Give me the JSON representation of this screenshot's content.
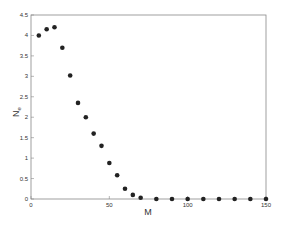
{
  "chart_data": {
    "type": "scatter",
    "title": "",
    "xlabel": "M",
    "ylabel": "N_e",
    "xlim": [
      0,
      150
    ],
    "ylim": [
      0,
      4.5
    ],
    "xticks": [
      0,
      50,
      100,
      150
    ],
    "yticks": [
      0,
      0.5,
      1,
      1.5,
      2,
      2.5,
      3,
      3.5,
      4,
      4.5
    ],
    "grid": false,
    "x": [
      5,
      10,
      15,
      20,
      25,
      30,
      35,
      40,
      45,
      50,
      55,
      60,
      65,
      70,
      80,
      90,
      100,
      110,
      120,
      130,
      140,
      150
    ],
    "y": [
      4.0,
      4.15,
      4.2,
      3.7,
      3.02,
      2.35,
      2.0,
      1.6,
      1.3,
      0.88,
      0.58,
      0.25,
      0.1,
      0.03,
      0.0,
      0.0,
      0.0,
      0.0,
      0.0,
      0.0,
      0.0,
      0.0
    ],
    "marker_color": "#222222"
  }
}
